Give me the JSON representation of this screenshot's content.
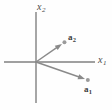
{
  "figure": {
    "background_color": "#fefefe",
    "axis_color": "#808080",
    "vector_color": "#8a8a8a",
    "label_color": "#4a4a4a",
    "vector_label_color": "#3c3c3c",
    "width": 112,
    "height": 110
  },
  "chart_data": {
    "type": "scatter",
    "title": "",
    "xlabel": "x",
    "xlabel_sub": "1",
    "ylabel": "x",
    "ylabel_sub": "2",
    "grid": false,
    "legend": "none",
    "origin": {
      "x": 36,
      "y": 62
    },
    "axes": {
      "horizontal": {
        "x_start": 4,
        "x_end": 95,
        "y": 62
      },
      "vertical": {
        "x": 36,
        "y_start": 12,
        "y_end": 103
      }
    },
    "annotations": [
      {
        "name": "a2",
        "label": "a",
        "label_sub": "2",
        "kind": "vector-arrow",
        "from": {
          "x": 36,
          "y": 62
        },
        "to": {
          "x": 62,
          "y": 44
        },
        "marker": "dot",
        "label_pos": {
          "x": 68,
          "y": 33
        }
      },
      {
        "name": "a1",
        "label": "a",
        "label_sub": "1",
        "kind": "vector-arrow",
        "from": {
          "x": 36,
          "y": 62
        },
        "to": {
          "x": 85,
          "y": 79
        },
        "marker": "dot",
        "label_pos": {
          "x": 84,
          "y": 85
        }
      }
    ]
  },
  "labels": {
    "x_axis": "x",
    "x_axis_sub": "1",
    "y_axis": "x",
    "y_axis_sub": "2",
    "vector_a1": "a",
    "vector_a1_sub": "1",
    "vector_a2": "a",
    "vector_a2_sub": "2"
  }
}
